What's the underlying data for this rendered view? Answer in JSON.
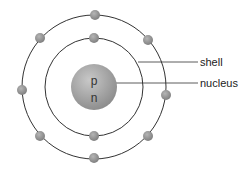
{
  "diagram": {
    "labels": {
      "shell": "shell",
      "nucleus": "nucleus"
    },
    "nucleus": {
      "top": "p",
      "bottom": "n",
      "cx": 94,
      "cy": 87,
      "r": 23
    },
    "shells": [
      {
        "name": "inner",
        "r": 49,
        "electrons": 2
      },
      {
        "name": "outer",
        "r": 72,
        "electrons": 8
      }
    ],
    "colors": {
      "electron": "#8f8f8f",
      "nucleus": "#9a9a9a",
      "line": "#333333"
    }
  }
}
